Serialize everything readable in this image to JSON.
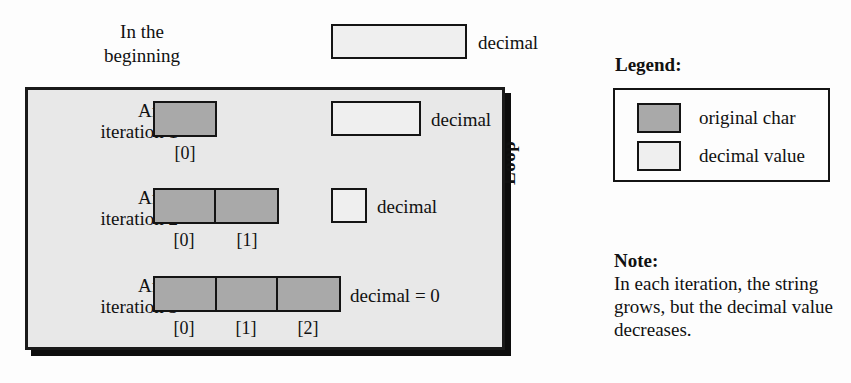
{
  "diagram": {
    "beginning": {
      "label": "In the\nbeginning",
      "decimal_label": "decimal"
    },
    "loop": {
      "caption": "Loop",
      "rows": [
        {
          "row_label": "After\niteration 1",
          "cells": 1,
          "indices": [
            "[0]"
          ],
          "decimal_label": "decimal",
          "decimal_has_box": true
        },
        {
          "row_label": "After\niteration 2",
          "cells": 2,
          "indices": [
            "[0]",
            "[1]"
          ],
          "decimal_label": "decimal",
          "decimal_has_box": true
        },
        {
          "row_label": "After\niteration 3",
          "cells": 3,
          "indices": [
            "[0]",
            "[1]",
            "[2]"
          ],
          "decimal_label": "decimal = 0",
          "decimal_has_box": false
        }
      ]
    },
    "legend": {
      "title": "Legend:",
      "entries": [
        {
          "swatch": "original-char-swatch",
          "label": "original char"
        },
        {
          "swatch": "decimal-value-swatch",
          "label": "decimal value"
        }
      ]
    },
    "note": {
      "title": "Note:",
      "body": "In each iteration, the string grows, but the decimal value decreases."
    },
    "colors": {
      "original_char": "#a9a9a9",
      "decimal_value": "#efefef",
      "loop_background": "#e8e8e8",
      "outline": "#141414",
      "page_background": "#fdfdfd"
    }
  }
}
